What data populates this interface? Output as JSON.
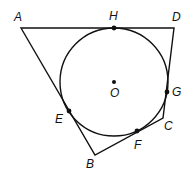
{
  "diagram": {
    "circle": {
      "center_label": "O",
      "cx": 114,
      "cy": 82,
      "r": 54
    },
    "vertices": [
      {
        "label": "A",
        "x": 21,
        "y": 28
      },
      {
        "label": "B",
        "x": 95,
        "y": 155
      },
      {
        "label": "C",
        "x": 163,
        "y": 118
      },
      {
        "label": "D",
        "x": 174,
        "y": 28
      }
    ],
    "tangent_points": [
      {
        "label": "H",
        "x": 114,
        "y": 28
      },
      {
        "label": "G",
        "x": 167,
        "y": 92
      },
      {
        "label": "F",
        "x": 137,
        "y": 131
      },
      {
        "label": "E",
        "x": 69,
        "y": 111
      }
    ],
    "labels": {
      "A": "A",
      "B": "B",
      "C": "C",
      "D": "D",
      "E": "E",
      "F": "F",
      "G": "G",
      "H": "H",
      "O": "O"
    },
    "colors": {
      "stroke": "#111111",
      "background": "#ffffff"
    }
  }
}
